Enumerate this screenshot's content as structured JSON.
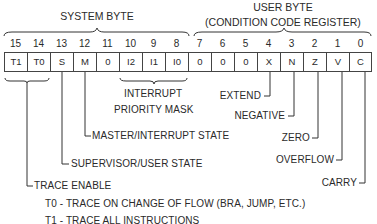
{
  "header": {
    "system_byte_label": "SYSTEM BYTE",
    "user_byte_label": "USER BYTE",
    "user_byte_sublabel": "(CONDITION CODE REGISTER)"
  },
  "register": {
    "bits": [
      {
        "num": "15",
        "value": "T1"
      },
      {
        "num": "14",
        "value": "T0"
      },
      {
        "num": "13",
        "value": "S"
      },
      {
        "num": "12",
        "value": "M"
      },
      {
        "num": "11",
        "value": "0"
      },
      {
        "num": "10",
        "value": "I2"
      },
      {
        "num": "9",
        "value": "I1"
      },
      {
        "num": "8",
        "value": "I0"
      },
      {
        "num": "7",
        "value": "0"
      },
      {
        "num": "6",
        "value": "0"
      },
      {
        "num": "5",
        "value": "0"
      },
      {
        "num": "4",
        "value": "X"
      },
      {
        "num": "3",
        "value": "N"
      },
      {
        "num": "2",
        "value": "Z"
      },
      {
        "num": "1",
        "value": "V"
      },
      {
        "num": "0",
        "value": "C"
      }
    ]
  },
  "annotations": {
    "interrupt_mask_line1": "INTERRUPT",
    "interrupt_mask_line2": "PRIORITY MASK",
    "master_interrupt_state": "MASTER/INTERRUPT STATE",
    "supervisor_user_state": "SUPERVISOR/USER STATE",
    "trace_enable": "TRACE ENABLE",
    "trace_t0": "T0 - TRACE ON CHANGE OF FLOW (BRA, JUMP, ETC.)",
    "trace_t1": "T1 - TRACE ALL INSTRUCTIONS",
    "extend": "EXTEND",
    "negative": "NEGATIVE",
    "zero": "ZERO",
    "overflow": "OVERFLOW",
    "carry": "CARRY"
  },
  "colors": {
    "ink": "#2a2a2a",
    "background": "#ffffff"
  }
}
